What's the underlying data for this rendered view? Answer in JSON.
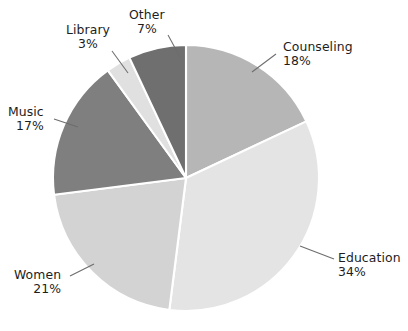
{
  "chart_data": {
    "type": "pie",
    "title": "",
    "subtitle": "",
    "xlabel": "",
    "ylabel": "",
    "legend_position": "none",
    "grid": false,
    "value_unit": "percent",
    "total": 100,
    "start_angle_deg": 0,
    "direction": "clockwise",
    "categories": [
      "Counseling",
      "Education",
      "Women",
      "Music",
      "Library",
      "Other"
    ],
    "values": [
      18,
      34,
      21,
      17,
      3,
      7
    ],
    "slices": [
      {
        "label": "Counseling",
        "value": 18,
        "percent_text": "18%",
        "color": "#b6b6b6",
        "start_deg": 0,
        "end_deg": 64.8,
        "label_align": "left",
        "label_left": 283,
        "label_top": 40,
        "leader": [
          [
            276,
            54
          ],
          [
            252,
            72
          ]
        ]
      },
      {
        "label": "Education",
        "value": 34,
        "percent_text": "34%",
        "color": "#e4e4e4",
        "start_deg": 64.8,
        "end_deg": 187.2,
        "label_align": "left",
        "label_left": 338,
        "label_top": 251,
        "leader": [
          [
            334,
            259
          ],
          [
            300,
            246
          ]
        ]
      },
      {
        "label": "Women",
        "value": 21,
        "percent_text": "21%",
        "color": "#d3d3d3",
        "start_deg": 187.2,
        "end_deg": 262.8,
        "label_align": "right",
        "label_left": 14,
        "label_top": 268,
        "leader": [
          [
            70,
            276
          ],
          [
            94,
            264
          ]
        ]
      },
      {
        "label": "Music",
        "value": 17,
        "percent_text": "17%",
        "color": "#7f7f7f",
        "start_deg": 262.8,
        "end_deg": 324.0,
        "label_align": "right",
        "label_left": 8,
        "label_top": 105,
        "leader": [
          [
            54,
            119
          ],
          [
            78,
            127
          ]
        ]
      },
      {
        "label": "Library",
        "value": 3,
        "percent_text": "3%",
        "color": "#e0e0e0",
        "start_deg": 324.0,
        "end_deg": 334.8,
        "label_align": "center",
        "label_left": 66,
        "label_top": 23,
        "leader": [
          [
            112,
            51
          ],
          [
            128,
            73
          ]
        ]
      },
      {
        "label": "Other",
        "value": 7,
        "percent_text": "7%",
        "color": "#6f6f6f",
        "start_deg": 334.8,
        "end_deg": 360.0,
        "label_align": "center",
        "label_left": 129,
        "label_top": 8,
        "leader": [
          [
            168,
            35
          ],
          [
            180,
            57
          ]
        ]
      }
    ],
    "geometry": {
      "center_x": 186,
      "center_y": 178,
      "radius": 133
    },
    "colors": {
      "background": "#ffffff",
      "slice_border": "#ffffff",
      "label_text": "#1d1d1d",
      "leader_line": "#6d6d6d"
    }
  }
}
